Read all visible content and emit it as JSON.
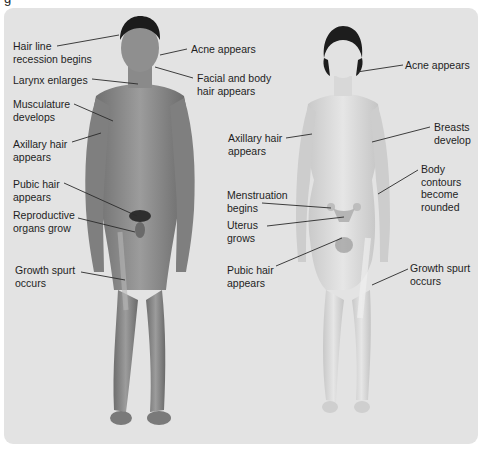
{
  "caption_fragment": "g",
  "male": {
    "labels": [
      {
        "id": "hairline",
        "text": "Hair line\nrecession begins"
      },
      {
        "id": "acne",
        "text": "Acne appears"
      },
      {
        "id": "facial-hair",
        "text": "Facial and body\nhair appears"
      },
      {
        "id": "larynx",
        "text": "Larynx enlarges"
      },
      {
        "id": "musculature",
        "text": "Musculature\ndevelops"
      },
      {
        "id": "axillary",
        "text": "Axillary hair\nappears"
      },
      {
        "id": "pubic",
        "text": "Pubic hair\nappears"
      },
      {
        "id": "reproductive",
        "text": "Reproductive\norgans grow"
      },
      {
        "id": "growth",
        "text": "Growth spurt\noccurs"
      }
    ]
  },
  "female": {
    "labels": [
      {
        "id": "acne",
        "text": "Acne appears"
      },
      {
        "id": "axillary",
        "text": "Axillary hair\nappears"
      },
      {
        "id": "breasts",
        "text": "Breasts\ndevelop"
      },
      {
        "id": "contours",
        "text": "Body\ncontours\nbecome\nrounded"
      },
      {
        "id": "menstruation",
        "text": "Menstruation\nbegins"
      },
      {
        "id": "uterus",
        "text": "Uterus\ngrows"
      },
      {
        "id": "pubic",
        "text": "Pubic hair\nappears"
      },
      {
        "id": "growth",
        "text": "Growth spurt\noccurs"
      }
    ]
  },
  "colors": {
    "panel": "#e3e3e3",
    "male_skin": "#8e8e8e",
    "female_skin": "#d6d6d6",
    "leader_line": "#2a2a2a"
  }
}
